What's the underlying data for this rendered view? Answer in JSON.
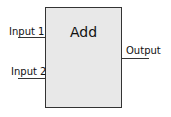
{
  "block": {
    "title": "Add"
  },
  "ports": {
    "inputs": [
      {
        "label": "Input 1"
      },
      {
        "label": "Input 2"
      }
    ],
    "output": {
      "label": "Output"
    }
  }
}
